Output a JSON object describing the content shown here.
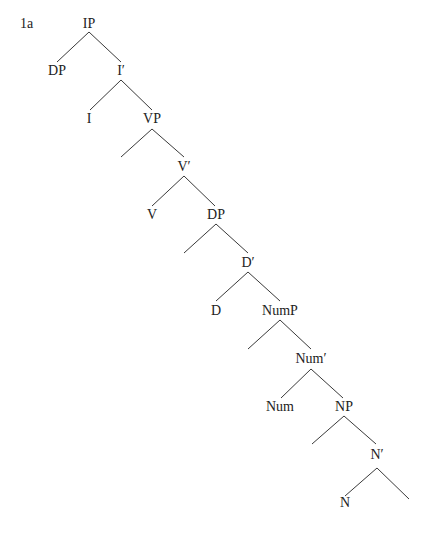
{
  "example": {
    "label": "1a"
  },
  "tree": {
    "type": "syntax-tree",
    "nodes": [
      {
        "id": "ip",
        "label": "IP",
        "x": 89,
        "y": 17
      },
      {
        "id": "dp-spec",
        "label": "DP",
        "x": 57,
        "y": 64
      },
      {
        "id": "i-bar",
        "label": "I′",
        "x": 121,
        "y": 64
      },
      {
        "id": "i",
        "label": "I",
        "x": 89,
        "y": 112
      },
      {
        "id": "vp",
        "label": "VP",
        "x": 152,
        "y": 112
      },
      {
        "id": "v-bar",
        "label": "V′",
        "x": 184,
        "y": 160
      },
      {
        "id": "v",
        "label": "V",
        "x": 152,
        "y": 208
      },
      {
        "id": "dp",
        "label": "DP",
        "x": 216,
        "y": 208
      },
      {
        "id": "d-bar",
        "label": "D′",
        "x": 248,
        "y": 256
      },
      {
        "id": "d",
        "label": "D",
        "x": 216,
        "y": 304
      },
      {
        "id": "nump",
        "label": "NumP",
        "x": 280,
        "y": 304
      },
      {
        "id": "num-bar",
        "label": "Num′",
        "x": 311,
        "y": 352
      },
      {
        "id": "num",
        "label": "Num",
        "x": 280,
        "y": 400
      },
      {
        "id": "np",
        "label": "NP",
        "x": 344,
        "y": 400
      },
      {
        "id": "n-bar",
        "label": "N′",
        "x": 377,
        "y": 448
      },
      {
        "id": "n",
        "label": "N",
        "x": 345,
        "y": 496
      }
    ],
    "edges": [
      {
        "from": "ip",
        "x1": 89,
        "y1": 32,
        "x2": 57,
        "y2": 62
      },
      {
        "from": "ip",
        "x1": 89,
        "y1": 32,
        "x2": 121,
        "y2": 62
      },
      {
        "from": "i-bar",
        "x1": 121,
        "y1": 80,
        "x2": 90,
        "y2": 110
      },
      {
        "from": "i-bar",
        "x1": 121,
        "y1": 80,
        "x2": 152,
        "y2": 110
      },
      {
        "from": "vp",
        "x1": 152,
        "y1": 129,
        "x2": 121,
        "y2": 157,
        "empty": true
      },
      {
        "from": "vp",
        "x1": 152,
        "y1": 129,
        "x2": 184,
        "y2": 157
      },
      {
        "from": "v-bar",
        "x1": 184,
        "y1": 176,
        "x2": 152,
        "y2": 206
      },
      {
        "from": "v-bar",
        "x1": 184,
        "y1": 176,
        "x2": 215,
        "y2": 206
      },
      {
        "from": "dp",
        "x1": 216,
        "y1": 224,
        "x2": 184,
        "y2": 253,
        "empty": true
      },
      {
        "from": "dp",
        "x1": 216,
        "y1": 224,
        "x2": 248,
        "y2": 253
      },
      {
        "from": "d-bar",
        "x1": 248,
        "y1": 272,
        "x2": 216,
        "y2": 301
      },
      {
        "from": "d-bar",
        "x1": 248,
        "y1": 272,
        "x2": 280,
        "y2": 301
      },
      {
        "from": "nump",
        "x1": 280,
        "y1": 320,
        "x2": 248,
        "y2": 349,
        "empty": true
      },
      {
        "from": "nump",
        "x1": 280,
        "y1": 320,
        "x2": 311,
        "y2": 349
      },
      {
        "from": "num-bar",
        "x1": 311,
        "y1": 369,
        "x2": 281,
        "y2": 398
      },
      {
        "from": "num-bar",
        "x1": 311,
        "y1": 369,
        "x2": 343,
        "y2": 398
      },
      {
        "from": "np",
        "x1": 344,
        "y1": 416,
        "x2": 312,
        "y2": 444,
        "empty": true
      },
      {
        "from": "np",
        "x1": 344,
        "y1": 416,
        "x2": 376,
        "y2": 444
      },
      {
        "from": "n-bar",
        "x1": 377,
        "y1": 468,
        "x2": 345,
        "y2": 496
      },
      {
        "from": "n-bar",
        "x1": 377,
        "y1": 468,
        "x2": 409,
        "y2": 499,
        "empty": true
      }
    ]
  }
}
